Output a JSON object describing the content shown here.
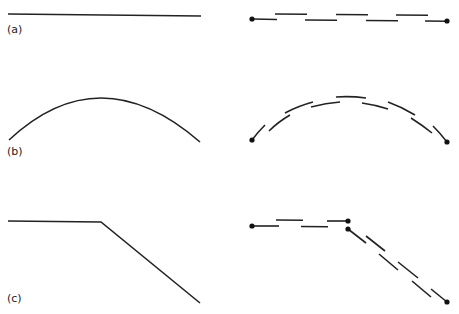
{
  "panels": [
    {
      "label": "(a)",
      "description": "straight line and its dashed decomposition"
    },
    {
      "label": "(b)",
      "description": "arc and its dashed decomposition"
    },
    {
      "label": "(c)",
      "description": "polyline with bend and its dashed decomposition"
    }
  ],
  "colors": {
    "stroke": "#222222",
    "background": "#ffffff"
  }
}
